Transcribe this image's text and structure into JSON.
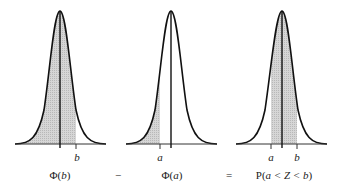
{
  "panels": [
    {
      "id": "phi-b",
      "tick_labels": [
        {
          "text": "b",
          "x": 76
        }
      ],
      "caption": {
        "prefix": "Φ(",
        "var": "b",
        "suffix": ")"
      },
      "shade": {
        "from": "left",
        "to": "b"
      }
    },
    {
      "id": "phi-a",
      "tick_labels": [
        {
          "text": "a",
          "x": 160
        }
      ],
      "caption": {
        "prefix": "Φ(",
        "var": "a",
        "suffix": ")"
      },
      "shade": {
        "from": "left",
        "to": "a"
      }
    },
    {
      "id": "prob-a-b",
      "tick_labels": [
        {
          "text": "a",
          "x": 271
        },
        {
          "text": "b",
          "x": 297
        }
      ],
      "caption": {
        "prefix": "P(",
        "var": "a < Z < b",
        "suffix": ")"
      },
      "shade": {
        "from": "a",
        "to": "b"
      }
    }
  ],
  "operators": {
    "minus": "−",
    "equals": "="
  },
  "colors": {
    "curve": "#111111",
    "shade": "#c8c8c8",
    "axis": "#333333"
  }
}
